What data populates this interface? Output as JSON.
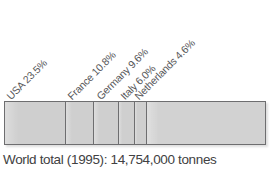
{
  "chart_data": {
    "type": "bar",
    "subtype": "stacked-horizontal-100-percent",
    "title": "",
    "xlabel": "",
    "ylabel": "",
    "categories": [
      "USA",
      "France",
      "Germany",
      "Italy",
      "Netherlands",
      "Other"
    ],
    "values": [
      23.5,
      10.8,
      9.6,
      6.0,
      4.6,
      45.5
    ],
    "value_unit": "%",
    "labels": [
      "USA 23.5%",
      "France 10.8%",
      "Germany 9.6%",
      "Italy 6.0%",
      "Netherlands 4.6%"
    ],
    "label_rotation_deg": 45,
    "grid": false,
    "legend": "none",
    "xlim": [
      0,
      100
    ],
    "caption": "World total (1995): 14,754,000 tonnes",
    "total_year": "1995",
    "total_amount": "14,754,000",
    "total_unit": "tonnes",
    "colors": {
      "segment_fill": "#cfcfcf",
      "remainder_fill": "#d2d2d2",
      "segment_border": "#6e6e70",
      "label_text": "#58585a",
      "caption_text": "#414142",
      "background": "#ffffff"
    }
  },
  "caption": {
    "text": "World total (1995): 14,754,000 tonnes"
  }
}
